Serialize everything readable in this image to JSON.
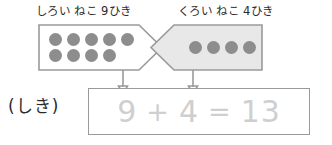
{
  "worksheet": {
    "groups": [
      {
        "id": "white-cats",
        "label": "しろい ねこ 9ひき",
        "count": 9,
        "rows": [
          5,
          4
        ],
        "fill": "#ffffff",
        "dot_color": "#8d8d8d"
      },
      {
        "id": "black-cats",
        "label": "くろい ねこ 4ひき",
        "count": 4,
        "rows": [
          4
        ],
        "fill": "#e8e8e8",
        "dot_color": "#8d8d8d"
      }
    ],
    "equation": {
      "prefix_label": "(しき)",
      "tokens": [
        "9",
        "+",
        "4",
        "=",
        "13"
      ],
      "addend_left": "9",
      "operator": "+",
      "addend_right": "4",
      "equals": "=",
      "sum": "13",
      "text_color": "#cfcfcf"
    },
    "connectors": [
      {
        "id": "connector-left",
        "from": "white-cats",
        "to": "addend-left"
      },
      {
        "id": "connector-right",
        "from": "black-cats",
        "to": "addend-right"
      }
    ],
    "colors": {
      "outline": "#9a9a9a",
      "dot": "#8d8d8d",
      "ink": "#2b2b2b",
      "traced": "#cfcfcf",
      "shaded_fill": "#e8e8e8"
    }
  }
}
